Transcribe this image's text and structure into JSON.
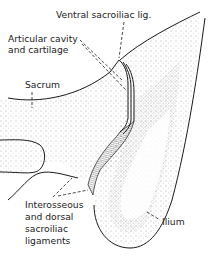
{
  "labels": {
    "ventral": "Ventral sacroiliac lig.",
    "articular_line1": "Articular cavity",
    "articular_line2": "and cartilage",
    "sacrum": "Sacrum",
    "interosseous_line1": "Interosseous",
    "interosseous_line2": "and dorsal",
    "interosseous_line3": "sacroiliac",
    "interosseous_line4": "ligaments",
    "ilium": "Ilium"
  },
  "colors": {
    "ink": "#1a1a1a",
    "stipple": "#555555",
    "background": "#ffffff"
  }
}
